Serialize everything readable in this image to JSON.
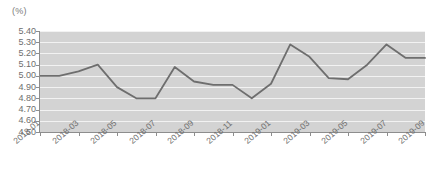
{
  "chart_data": {
    "type": "line",
    "title": "",
    "subtitle": "",
    "xlabel": "",
    "ylabel": "",
    "unit_label": "(%)",
    "ylim": [
      4.5,
      5.4
    ],
    "ytick_labels": [
      "5.40",
      "5.30",
      "5.20",
      "5.10",
      "5.00",
      "4.90",
      "4.80",
      "4.70",
      "4.60",
      "4.50"
    ],
    "ytick_values": [
      5.4,
      5.3,
      5.2,
      5.1,
      5.0,
      4.9,
      4.8,
      4.7,
      4.6,
      4.5
    ],
    "grid": true,
    "legend": "none",
    "x": [
      "2018-01",
      "2018-02",
      "2018-03",
      "2018-04",
      "2018-05",
      "2018-06",
      "2018-07",
      "2018-08",
      "2018-09",
      "2018-10",
      "2018-11",
      "2018-12",
      "2019-01",
      "2019-02",
      "2019-03",
      "2019-04",
      "2019-05",
      "2019-06",
      "2019-07",
      "2019-08",
      "2019-09"
    ],
    "xtick_labels": [
      "2018-01",
      "2018-03",
      "2018-05",
      "2018-07",
      "2018-09",
      "2018-11",
      "2019-01",
      "2019-03",
      "2019-05",
      "2019-07",
      "2019-09"
    ],
    "values": [
      5.0,
      5.0,
      5.04,
      5.1,
      4.9,
      4.8,
      4.8,
      5.08,
      4.95,
      4.92,
      4.92,
      4.8,
      4.93,
      5.28,
      5.17,
      4.98,
      4.97,
      5.1,
      5.28,
      5.16,
      5.16
    ],
    "series": [
      {
        "name": "rate",
        "color": "#6e6e6e",
        "values": [
          5.0,
          5.0,
          5.04,
          5.1,
          4.9,
          4.8,
          4.8,
          5.08,
          4.95,
          4.92,
          4.92,
          4.8,
          4.93,
          5.28,
          5.17,
          4.98,
          4.97,
          5.1,
          5.28,
          5.16,
          5.16
        ]
      }
    ],
    "colors": {
      "line": "#6e6e6e",
      "plot_background": "#d3d3d3",
      "gridline": "#f2f2f2",
      "axis": "#8d8d8d",
      "text": "#6e6e6e",
      "page_background": "#ffffff"
    }
  }
}
